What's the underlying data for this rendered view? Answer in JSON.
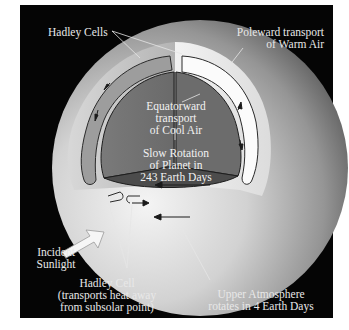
{
  "figure": {
    "colors": {
      "background": "#050505",
      "frame": "#ffffff",
      "sphere_light": "#e6e6e6",
      "sphere_dark": "#6a6a6a",
      "cell_band": "#a9a9a9",
      "core": "#6f6f6f",
      "core_dark": "#4a4a4a",
      "label_text": "#e8e8e8"
    }
  },
  "labels": {
    "hadley_cells": "Hadley Cells",
    "poleward_line1": "Poleward transport",
    "poleward_line2": "of Warm Air",
    "equatorward_line1": "Equatorward",
    "equatorward_line2": "transport",
    "equatorward_line3": "of Cool Air",
    "rotation_line1": "Slow Rotation",
    "rotation_line2": "of Planet in",
    "rotation_line3": "243 Earth Days",
    "incident_line1": "Incident",
    "incident_line2": "Sunlight",
    "hadley_cell_line1": "Hadley Cell",
    "hadley_cell_line2": "(transports heat away",
    "hadley_cell_line3": "from subsolar point)",
    "upper_line1": "Upper Atmosphere",
    "upper_line2": "rotates in 4 Earth Days"
  },
  "icons": {
    "sunlight": "block-arrow-icon",
    "flow": "flow-arrow-icon"
  }
}
